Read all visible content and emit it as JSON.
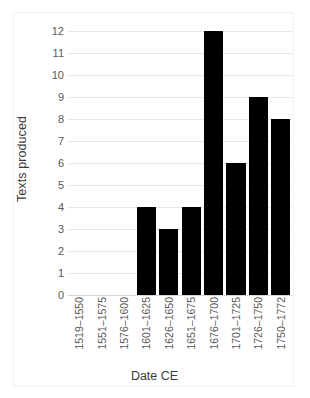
{
  "chart_data": {
    "type": "bar",
    "title": "",
    "xlabel": "Date CE",
    "ylabel": "Texts produced",
    "categories": [
      "1519–1550",
      "1551–1575",
      "1576–1600",
      "1601–1625",
      "1626–1650",
      "1651–1675",
      "1676–1700",
      "1701–1725",
      "1726–1750",
      "1750–1772"
    ],
    "values": [
      0,
      0,
      0,
      4,
      3,
      4,
      12,
      6,
      9,
      8
    ],
    "ylim": [
      0,
      12
    ],
    "ytick_step": 1,
    "yticks": [
      "12",
      "11",
      "10",
      "9",
      "8",
      "7",
      "6",
      "5",
      "4",
      "3",
      "2",
      "1",
      "0"
    ],
    "grid": true,
    "grid_axis": "y",
    "legend": false,
    "legend_position": "none",
    "bar_color": "#000000",
    "grid_color": "#e8e8e8",
    "axis_text_color": "#595959",
    "title_text_color": "#3b3b3b",
    "background_color": "#ffffff",
    "border_color": "#f1f1f1"
  }
}
